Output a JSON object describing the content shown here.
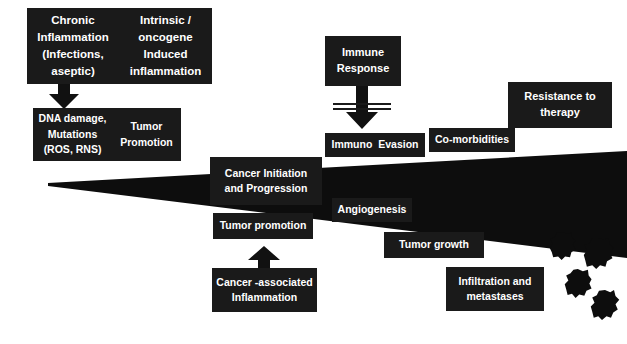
{
  "diagram": {
    "background_color": "#ffffff",
    "box_color": "#1a1a1a",
    "text_color": "#ffffff"
  },
  "boxes": {
    "chronic_inflammation": {
      "line1": "Chronic",
      "line2": "Inflammation",
      "line3": "(Infections, aseptic)"
    },
    "intrinsic_oncogene": {
      "line1": "Intrinsic  / oncogene",
      "line2": "Induced",
      "line3": "inflammation"
    },
    "dna_damage": {
      "line1": "DNA damage,",
      "line2": "Mutations",
      "line3": "(ROS, RNS)"
    },
    "tumor_promotion_top": {
      "line1": "Tumor",
      "line2": "Promotion"
    },
    "immune_response": {
      "line1": "Immune",
      "line2": "Response"
    },
    "immuno_evasion": {
      "line1": "Immuno  Evasion"
    },
    "co_morbidities": {
      "line1": "Co-morbidities"
    },
    "resistance_to_therapy": {
      "line1": "Resistance to",
      "line2": "therapy"
    },
    "cancer_initiation": {
      "line1": "Cancer Initiation",
      "line2": "and Progression"
    },
    "tumor_promotion_lower": {
      "line1": "Tumor promotion"
    },
    "angiogenesis": {
      "line1": "Angiogenesis"
    },
    "cancer_associated_inflammation": {
      "line1": "Cancer -associated",
      "line2": "Inflammation"
    },
    "tumor_growth": {
      "line1": "Tumor growth"
    },
    "infiltration_metastases": {
      "line1": "Infiltration and",
      "line2": "metastases"
    }
  },
  "icons": {
    "down_arrow_top": "down-arrow-icon",
    "down_arrow_immune": "down-arrow-icon",
    "up_arrow_inflammation": "up-arrow-icon",
    "inhibition_bars": "inhibition-bars-icon",
    "progression_wedge": "progression-wedge-icon",
    "cancer_cells": "cancer-cell-blob-icon"
  },
  "cancer_cells": [
    {
      "label": "cancer-cell-1"
    },
    {
      "label": "cancer-cell-2"
    },
    {
      "label": "cancer-cell-3"
    },
    {
      "label": "cancer-cell-4"
    }
  ]
}
